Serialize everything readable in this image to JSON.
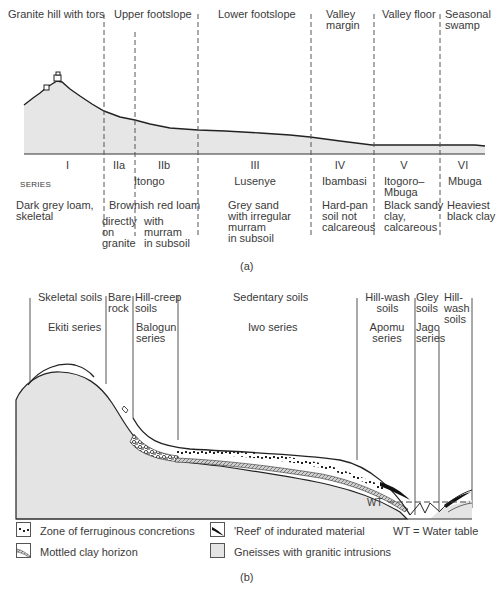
{
  "figure_a": {
    "zones": [
      {
        "label": "Granite hill with tors"
      },
      {
        "label": "Upper footslope"
      },
      {
        "label": "Lower footslope"
      },
      {
        "label": "Valley\nmargin"
      },
      {
        "label": "Valley floor"
      },
      {
        "label": "Seasonal\nswamp"
      }
    ],
    "series_heading": "SERIES",
    "series": [
      {
        "numeral": "I",
        "name": "",
        "description": "Dark grey loam,\nskeletal"
      },
      {
        "numeral": "IIa",
        "name": "",
        "description": "directly\non\ngranite"
      },
      {
        "numeral": "IIb",
        "name": "",
        "description": "with\nmurram\nin subsoil"
      },
      {
        "numeral": "III",
        "name": "Lusenye",
        "description": "Grey sand\nwith irregular\nmurram\nin subsoil"
      },
      {
        "numeral": "IV",
        "name": "Ibambasi",
        "description": "Hard-pan\nsoil not\ncalcareous"
      },
      {
        "numeral": "V",
        "name": "Itogoro–\nMbuga",
        "description": "Black sandy\nclay,\ncalcareous"
      },
      {
        "numeral": "VI",
        "name": "Mbuga",
        "description": "Heaviest\nblack clay"
      }
    ],
    "series_II_name": "Itongo",
    "series_II_description": "Brownish red loam",
    "caption": "(a)"
  },
  "figure_b": {
    "soil_groups": [
      {
        "label": "Skeletal soils",
        "series": "Ekiti series"
      },
      {
        "label": "Bare\nrock",
        "series": ""
      },
      {
        "label": "Hill-creep\nsoils",
        "series": "Balogun\nseries"
      },
      {
        "label": "Sedentary soils",
        "series": "Iwo series"
      },
      {
        "label": "Hill-wash\nsoils",
        "series": "Apomu\nseries"
      },
      {
        "label": "Gley\nsoils",
        "series": "Jago\nseries"
      },
      {
        "label": "Hill-\nwash\nsoils",
        "series": ""
      }
    ],
    "wt_label": "WT",
    "legend": [
      {
        "icon": "concretions-icon",
        "label": "Zone of ferruginous concretions"
      },
      {
        "icon": "reef-icon",
        "label": "'Reef' of indurated material"
      },
      {
        "icon": "wt-key",
        "label": "WT = Water table"
      },
      {
        "icon": "mottled-clay-icon",
        "label": "Mottled clay horizon"
      },
      {
        "icon": "gneiss-icon",
        "label": "Gneisses with granitic intrusions"
      }
    ],
    "caption": "(b)"
  },
  "colors": {
    "fill": "#e4e4e4",
    "line": "#222222",
    "text": "#3a3a3a"
  }
}
